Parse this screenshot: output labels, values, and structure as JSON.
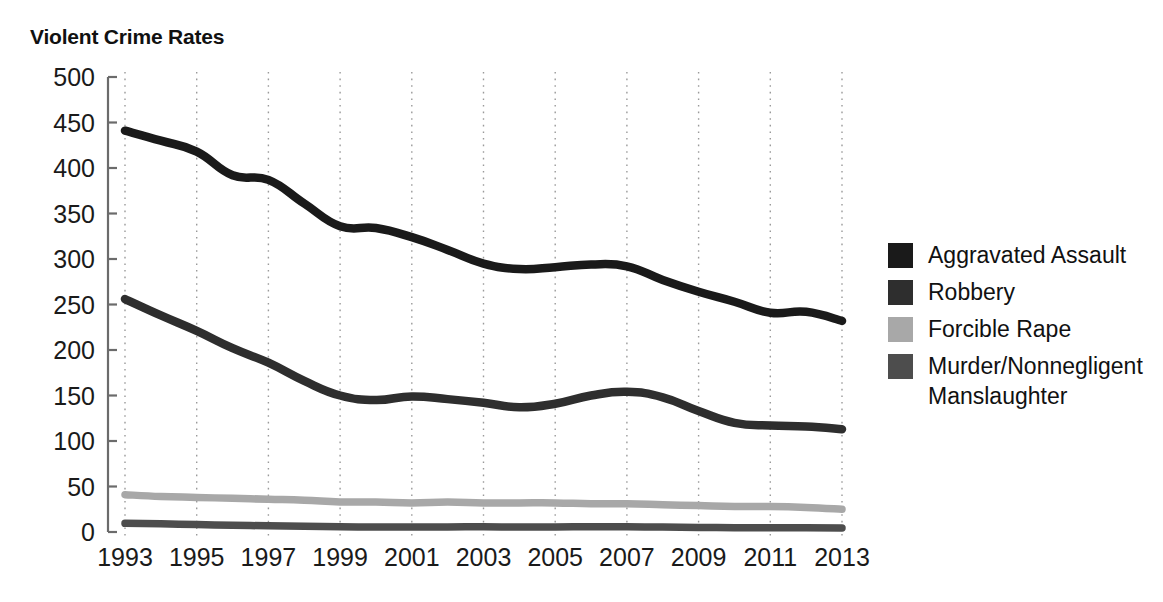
{
  "chart_data": {
    "type": "line",
    "title": "Violent Crime Rates",
    "xlabel": "",
    "ylabel": "",
    "ylim": [
      0,
      500
    ],
    "ytick_values": [
      0,
      50,
      100,
      150,
      200,
      250,
      300,
      350,
      400,
      450,
      500
    ],
    "ytick_labels": [
      "0",
      "50",
      "100",
      "150",
      "200",
      "250",
      "300",
      "350",
      "400",
      "450",
      "500"
    ],
    "grid": true,
    "grid_axis": "x",
    "legend_position": "right",
    "x": [
      1993,
      1994,
      1995,
      1996,
      1997,
      1998,
      1999,
      2000,
      2001,
      2002,
      2003,
      2004,
      2005,
      2006,
      2007,
      2008,
      2009,
      2010,
      2011,
      2012,
      2013
    ],
    "xtick_values": [
      1993,
      1995,
      1997,
      1999,
      2001,
      2003,
      2005,
      2007,
      2009,
      2011,
      2013
    ],
    "xtick_labels": [
      "1993",
      "1995",
      "1997",
      "1999",
      "2001",
      "2003",
      "2005",
      "2007",
      "2009",
      "2011",
      "2013"
    ],
    "series": [
      {
        "name": "Aggravated Assault",
        "color": "#1a1a1a",
        "values": [
          441,
          430,
          418,
          392,
          387,
          361,
          336,
          334,
          324,
          310,
          295,
          289,
          291,
          294,
          292,
          277,
          264,
          253,
          241,
          242,
          232
        ]
      },
      {
        "name": "Robbery",
        "color": "#2e2e2e",
        "values": [
          256,
          238,
          221,
          202,
          186,
          166,
          150,
          145,
          149,
          146,
          142,
          137,
          141,
          150,
          154,
          148,
          133,
          120,
          117,
          116,
          113
        ]
      },
      {
        "name": "Forcible Rape",
        "color": "#a8a8a8",
        "values": [
          41,
          39,
          38,
          37,
          36,
          35,
          33,
          33,
          32,
          33,
          32,
          32,
          32,
          31,
          31,
          30,
          29,
          28,
          28,
          27,
          25
        ]
      },
      {
        "name": "Murder/Nonnegligent Manslaughter",
        "color": "#4d4d4d",
        "values": [
          9.5,
          9.0,
          8.2,
          7.4,
          6.8,
          6.3,
          5.7,
          5.5,
          5.6,
          5.6,
          5.7,
          5.5,
          5.6,
          5.8,
          5.7,
          5.4,
          5.0,
          4.8,
          4.7,
          4.7,
          4.5
        ]
      }
    ]
  },
  "legend": {
    "entries": [
      {
        "label": "Aggravated Assault",
        "color": "#1a1a1a"
      },
      {
        "label": "Robbery",
        "color": "#2e2e2e"
      },
      {
        "label": "Forcible Rape",
        "color": "#a8a8a8"
      },
      {
        "label": "Murder/Nonnegligent",
        "label2": "Manslaughter",
        "color": "#4d4d4d"
      }
    ]
  }
}
